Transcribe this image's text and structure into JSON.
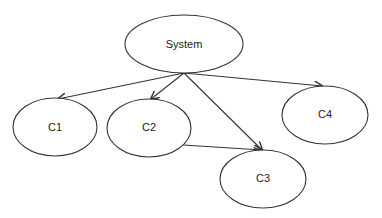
{
  "diagram": {
    "title": "",
    "line_color": "#333333",
    "nodes": {
      "system": {
        "label": "System",
        "cx": 184,
        "cy": 44,
        "rx": 59,
        "ry": 29
      },
      "c1": {
        "label": "C1",
        "cx": 55,
        "cy": 127,
        "rx": 42,
        "ry": 29
      },
      "c2": {
        "label": "C2",
        "cx": 149,
        "cy": 128,
        "rx": 42,
        "ry": 29
      },
      "c3": {
        "label": "C3",
        "cx": 263,
        "cy": 179,
        "rx": 43,
        "ry": 29
      },
      "c4": {
        "label": "C4",
        "cx": 325,
        "cy": 115,
        "rx": 43,
        "ry": 29
      }
    },
    "edges": [
      {
        "from": "System",
        "to": "C1",
        "x1": 184,
        "y1": 73,
        "x2": 58,
        "y2": 99
      },
      {
        "from": "System",
        "to": "C2",
        "x1": 184,
        "y1": 73,
        "x2": 151,
        "y2": 99
      },
      {
        "from": "System",
        "to": "C3",
        "x1": 184,
        "y1": 73,
        "x2": 262,
        "y2": 150
      },
      {
        "from": "System",
        "to": "C4",
        "x1": 184,
        "y1": 73,
        "x2": 322,
        "y2": 86
      },
      {
        "from": "C2",
        "to": "C3",
        "x1": 183,
        "y1": 145,
        "x2": 262,
        "y2": 150
      }
    ]
  }
}
